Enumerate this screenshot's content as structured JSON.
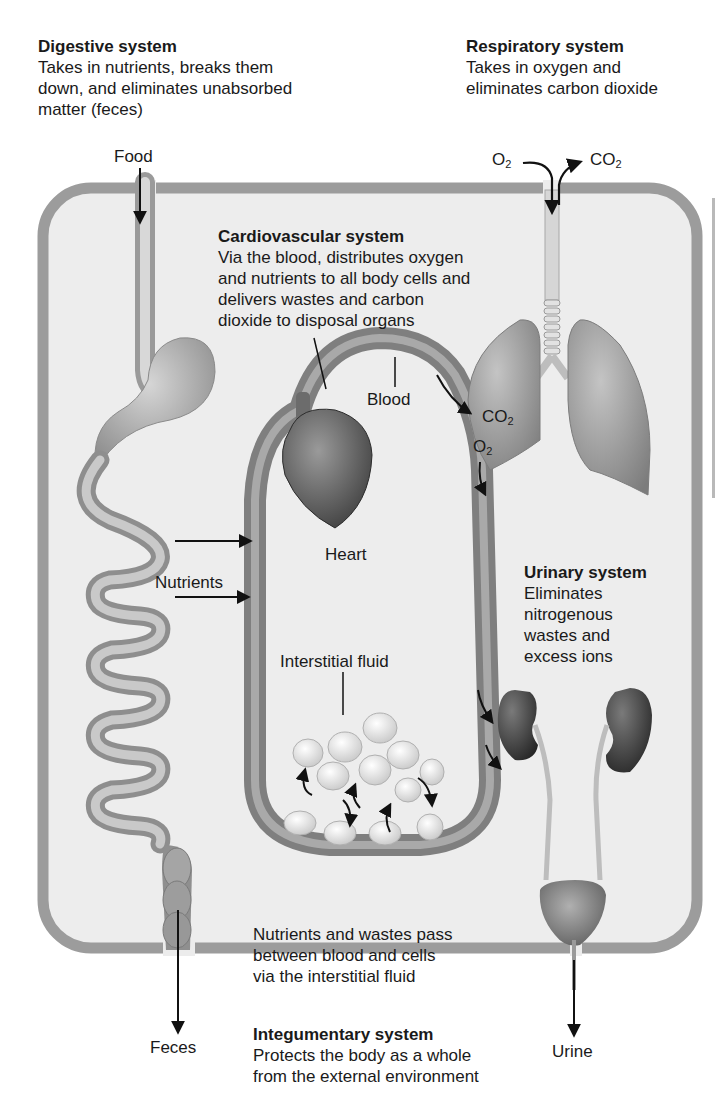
{
  "systems": {
    "digestive": {
      "title": "Digestive system",
      "lines": [
        "Takes in nutrients, breaks them",
        "down, and eliminates unabsorbed",
        "matter (feces)"
      ]
    },
    "respiratory": {
      "title": "Respiratory system",
      "lines": [
        "Takes in oxygen and",
        "eliminates carbon dioxide"
      ]
    },
    "cardiovascular": {
      "title": "Cardiovascular system",
      "lines": [
        "Via the blood, distributes oxygen",
        "and nutrients to all body cells and",
        "delivers wastes and carbon",
        "dioxide to disposal organs"
      ]
    },
    "urinary": {
      "title": "Urinary system",
      "lines": [
        "Eliminates",
        "nitrogenous",
        "wastes and",
        "excess ions"
      ]
    },
    "integumentary": {
      "title": "Integumentary system",
      "lines": [
        "Protects the body as a whole",
        "from the external environment"
      ]
    }
  },
  "labels": {
    "food": "Food",
    "feces": "Feces",
    "urine": "Urine",
    "blood": "Blood",
    "heart": "Heart",
    "nutrients": "Nutrients",
    "interstitial_fluid": "Interstitial fluid",
    "exchange_note": [
      "Nutrients and wastes pass",
      "between blood and cells",
      "via the interstitial fluid"
    ],
    "o2_base": "O",
    "co2_base": "CO",
    "subscript_2": "2"
  },
  "colors": {
    "body_border": "#9a9a9a",
    "body_fill": "#ececec",
    "organ_gray": "#8a8a8a",
    "kidney_dark": "#3e3e3e",
    "arrow": "#111111"
  }
}
